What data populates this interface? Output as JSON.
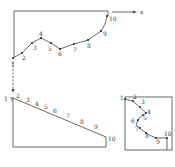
{
  "diagram": {
    "axis_x_label": "x",
    "axis_y_label": "y",
    "top_figure": {
      "points": [
        {
          "n": "1",
          "x": 13,
          "y": 58
        },
        {
          "n": "2",
          "x": 22,
          "y": 53
        },
        {
          "n": "3",
          "x": 32,
          "y": 43
        },
        {
          "n": "4",
          "x": 41,
          "y": 38
        },
        {
          "n": "5",
          "x": 51,
          "y": 43
        },
        {
          "n": "6",
          "x": 60,
          "y": 49
        },
        {
          "n": "7",
          "x": 74,
          "y": 44
        },
        {
          "n": "8",
          "x": 88,
          "y": 40
        },
        {
          "n": "9",
          "x": 101,
          "y": 31
        },
        {
          "n": "10",
          "x": 107,
          "y": 16
        }
      ]
    },
    "bottom_figure": {
      "labels": [
        "1",
        "2",
        "3",
        "4",
        "5",
        "6",
        "7",
        "8",
        "9",
        "10"
      ]
    },
    "small_figure": {
      "labels": [
        "1",
        "2",
        "3",
        "4",
        "5",
        "6",
        "7",
        "8",
        "9",
        "10"
      ]
    }
  }
}
